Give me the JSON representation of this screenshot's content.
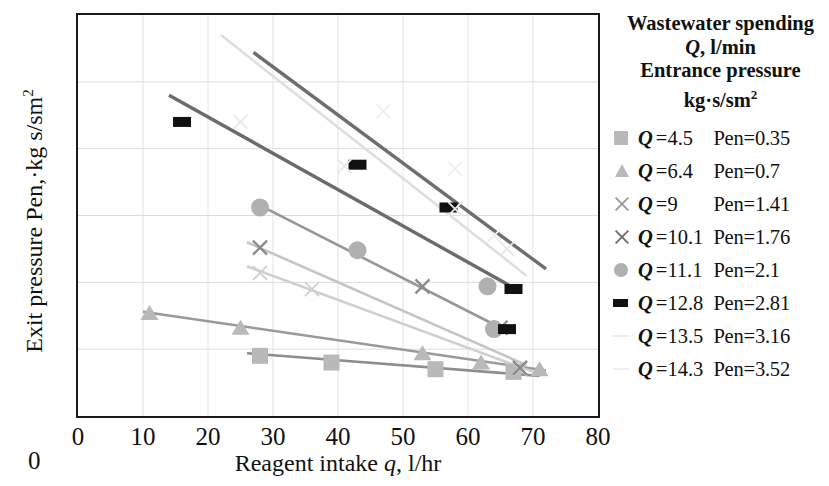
{
  "chart_data": {
    "type": "scatter",
    "title": "",
    "xlabel": "Reagent intake q, l/hr",
    "ylabel": "Exit pressure Pen,·kg s/sm²",
    "xlim": [
      0,
      80
    ],
    "ylim": [
      0,
      3
    ],
    "xticks": [
      "0",
      "10",
      "20",
      "30",
      "40",
      "50",
      "60",
      "70",
      "80"
    ],
    "yticks": [
      "0",
      "0.5",
      "1",
      "1.5",
      "2",
      "2.5",
      "3"
    ],
    "grid": true,
    "legend_position": "right",
    "legend_title": [
      "Wastewater spending",
      "Q, l/min",
      "Entrance pressure",
      "kg·s/sm²"
    ],
    "series": [
      {
        "name": "Q = 4.5  Pen=0.35",
        "q_label": "4.5",
        "pen_label": "Pen=0.35",
        "marker": "square",
        "color": "#b9b9b9",
        "line_color": "#8d8d8d",
        "points": [
          [
            28,
            0.45
          ],
          [
            39,
            0.4
          ],
          [
            55,
            0.35
          ],
          [
            67,
            0.33
          ]
        ],
        "trend": [
          [
            26,
            0.47
          ],
          [
            71,
            0.3
          ]
        ]
      },
      {
        "name": "Q = 6.4  Pen=0.7",
        "q_label": "6.4",
        "pen_label": "Pen=0.7",
        "marker": "triangle",
        "color": "#b9b9b9",
        "line_color": "#999999",
        "points": [
          [
            11,
            0.77
          ],
          [
            25,
            0.66
          ],
          [
            53,
            0.47
          ],
          [
            62,
            0.4
          ],
          [
            71,
            0.35
          ]
        ],
        "trend": [
          [
            10,
            0.78
          ],
          [
            72,
            0.34
          ]
        ]
      },
      {
        "name": "Q = 9    Pen=1.41",
        "q_label": "9",
        "pen_label": "Pen=1.41",
        "marker": "x-light",
        "color": "#cfcfcf",
        "line_color": "#cfcfcf",
        "points": [
          [
            28,
            1.07
          ],
          [
            36,
            0.95
          ],
          [
            68,
            0.35
          ]
        ],
        "trend": [
          [
            26,
            1.12
          ],
          [
            70,
            0.33
          ]
        ]
      },
      {
        "name": "Q = 10.1 Pen=1.76",
        "q_label": "10.1",
        "pen_label": "Pen=1.76",
        "marker": "x-dark",
        "color": "#8a8a8a",
        "line_color": "#c4c4c4",
        "points": [
          [
            28,
            1.26
          ],
          [
            53,
            0.97
          ],
          [
            65,
            0.66
          ],
          [
            68,
            0.36
          ]
        ],
        "trend": [
          [
            26,
            1.3
          ],
          [
            69,
            0.38
          ]
        ]
      },
      {
        "name": "Q = 11.1 Pen=2.1",
        "q_label": "11.1",
        "pen_label": "Pen=2.1",
        "marker": "circle",
        "color": "#b0b0b0",
        "line_color": "#969696",
        "points": [
          [
            28,
            1.56
          ],
          [
            43,
            1.24
          ],
          [
            63,
            0.97
          ],
          [
            64,
            0.65
          ]
        ],
        "trend": [
          [
            27,
            1.6
          ],
          [
            65,
            0.66
          ]
        ]
      },
      {
        "name": "Q = 12.8 Pen=2.81",
        "q_label": "12.8",
        "pen_label": "Pen=2.81",
        "marker": "rect",
        "color": "#111111",
        "line_color": "#6b6b6b",
        "points": [
          [
            16,
            2.2
          ],
          [
            43,
            1.88
          ],
          [
            57,
            1.56
          ],
          [
            66,
            0.65
          ],
          [
            67,
            0.95
          ]
        ],
        "trend": [
          [
            14,
            2.4
          ],
          [
            67,
            0.96
          ]
        ]
      },
      {
        "name": "Q = 13.5 Pen=3.16",
        "q_label": "13.5",
        "pen_label": "Pen=3.16",
        "marker": "dash",
        "color": "#e8e8e8",
        "line_color": "#6e6e6e",
        "points": [
          [
            25,
            2.2
          ],
          [
            41,
            1.87
          ],
          [
            58,
            1.55
          ],
          [
            66,
            1.25
          ]
        ],
        "trend": [
          [
            27,
            2.72
          ],
          [
            72,
            1.1
          ]
        ]
      },
      {
        "name": "Q = 14.3 Pen=3.52",
        "q_label": "14.3",
        "pen_label": "Pen=3.52",
        "marker": "dash2",
        "color": "#efefef",
        "line_color": "#dedede",
        "points": [
          [
            47,
            2.28
          ],
          [
            58,
            1.85
          ],
          [
            64,
            1.35
          ]
        ],
        "trend": [
          [
            22,
            2.85
          ],
          [
            69,
            1.05
          ]
        ]
      }
    ]
  },
  "axes": {
    "x_title": "Reagent intake q, l/hr",
    "x_title_pre": "Reagent intake ",
    "x_title_var": "q",
    "x_title_post": ", l/hr",
    "y_title_text": "Exit pressure Pen,·kg s/sm",
    "y_title_sup": "2",
    "origin_extra": "0",
    "xticks": [
      "0",
      "10",
      "20",
      "30",
      "40",
      "50",
      "60",
      "70",
      "80"
    ],
    "yticks": [
      "3",
      "2.5",
      "2",
      "1.5",
      "1",
      "0.5",
      "0"
    ]
  },
  "legend": {
    "title_line1": "Wastewater spending",
    "title_line2_var": "Q",
    "title_line2_rest": ", l/min",
    "title_line3": "Entrance pressure",
    "title_line4": "kg·s/sm",
    "title_line4_sup": "2",
    "eq": "=",
    "q_var": "Q",
    "items": [
      {
        "q": "4.5",
        "pen": "Pen=0.35",
        "marker": "square"
      },
      {
        "q": "6.4",
        "pen": "Pen=0.7",
        "marker": "triangle"
      },
      {
        "q": "9",
        "pen": "Pen=1.41",
        "marker": "x-light"
      },
      {
        "q": "10.1",
        "pen": "Pen=1.76",
        "marker": "x-dark"
      },
      {
        "q": "11.1",
        "pen": "Pen=2.1",
        "marker": "circle"
      },
      {
        "q": "12.8",
        "pen": "Pen=2.81",
        "marker": "rect"
      },
      {
        "q": "13.5",
        "pen": "Pen=3.16",
        "marker": "dash"
      },
      {
        "q": "14.3",
        "pen": "Pen=3.52",
        "marker": "dash2"
      }
    ]
  }
}
